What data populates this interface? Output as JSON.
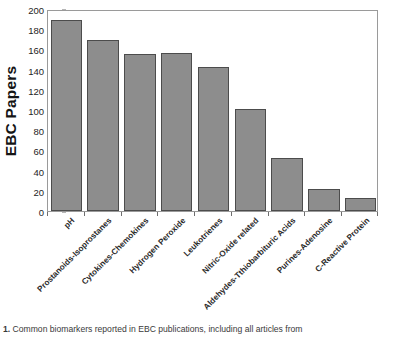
{
  "figure": {
    "caption_label": "1.",
    "caption_text": "Common biomarkers reported in EBC publications, including all articles from"
  },
  "chart_data": {
    "type": "bar",
    "title": "",
    "subtitle": "",
    "xlabel": "",
    "ylabel": "EBC Papers",
    "ylim": [
      0,
      200
    ],
    "yticks": [
      0,
      20,
      40,
      60,
      80,
      100,
      120,
      140,
      160,
      180,
      200
    ],
    "grid": false,
    "legend": false,
    "legend_position": "none",
    "bar_fill_color": "#8d8d8d",
    "bar_edge_color": "#4c4c4c",
    "categories": [
      "pH",
      "Prostanoids-Isoprostanes",
      "Cytokines-Chemokines",
      "Hydrogen Peroxide",
      "Leukotrienes",
      "Nitric-Oxide related",
      "Aldehydes-Tthiobarbituric Acids",
      "Purines-Adenosine",
      "C-Reactive Protein"
    ],
    "values": [
      189,
      169,
      155,
      156,
      143,
      101,
      52,
      22,
      13
    ]
  }
}
